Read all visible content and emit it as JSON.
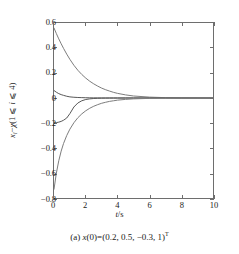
{
  "figure": {
    "caption_prefix": "(a) ",
    "caption_var": "x",
    "caption_rest": "(0)=(0.2, 0.5, −0.3, 1)",
    "caption_sup": "T",
    "caption_full": "(a) x(0)=(0.2, 0.5, −0.3, 1)T"
  },
  "axes": {
    "xlabel_var": "t",
    "xlabel_slash": "/",
    "xlabel_unit": "s",
    "xlabel_full": "t/s",
    "ylabel_var": "x",
    "ylabel_sub": "i",
    "ylabel_mid": "−",
    "ylabel_chi": "χ",
    "ylabel_cond": "(1 ⩽ i ⩽ 4)",
    "ylabel_full": "xᵢ−χ(1 ⩽ i ⩽ 4)",
    "xticks": [
      "0",
      "2",
      "4",
      "6",
      "8",
      "10"
    ],
    "yticks": [
      "0.6",
      "0.4",
      "0.2",
      "0",
      "−0.2",
      "−0.4",
      "−0.6",
      "−0.8"
    ]
  },
  "colors": {
    "curve": "#7d7d7d",
    "curve_dark": "#585858",
    "frame": "#6e6e6e",
    "text": "#1a1a1a",
    "background": "#ffffff"
  },
  "chart_data": {
    "type": "line",
    "title": "",
    "subtitle": "",
    "xlabel": "t/s",
    "ylabel": "x_i − χ (1 ⩽ i ⩽ 4)",
    "xlim": [
      0,
      10
    ],
    "ylim": [
      -0.8,
      0.6
    ],
    "xticks": [
      0,
      2,
      4,
      6,
      8,
      10
    ],
    "yticks": [
      0.6,
      0.4,
      0.2,
      0,
      -0.2,
      -0.4,
      -0.6,
      -0.8
    ],
    "grid": false,
    "legend": null,
    "annotations": [
      "(a) x(0)=(0.2, 0.5, −0.3, 1)^T"
    ],
    "x": [
      0,
      0.15,
      0.3,
      0.45,
      0.6,
      0.8,
      1.0,
      1.25,
      1.5,
      1.75,
      2.0,
      2.25,
      2.5,
      2.75,
      3.0,
      3.25,
      3.5,
      3.75,
      4.0,
      4.5,
      5.0,
      6.0,
      7.0,
      8.0,
      9.0,
      10.0
    ],
    "series": [
      {
        "name": "x1 − χ",
        "color": "#7d7d7d",
        "values": [
          0.56,
          0.515,
          0.473,
          0.434,
          0.397,
          0.351,
          0.309,
          0.262,
          0.222,
          0.188,
          0.159,
          0.134,
          0.113,
          0.095,
          0.079,
          0.066,
          0.055,
          0.045,
          0.037,
          0.025,
          0.016,
          0.007,
          0.003,
          0.001,
          0.0005,
          0.0
        ]
      },
      {
        "name": "x2 − χ",
        "color": "#585858",
        "values": [
          0.06,
          0.046,
          0.035,
          0.027,
          0.021,
          0.014,
          0.009,
          0.006,
          0.004,
          0.003,
          0.002,
          0.0015,
          0.001,
          0.0008,
          0.0006,
          0.0004,
          0.0003,
          0.0002,
          0.0002,
          0.0001,
          0.0001,
          0.0,
          0.0,
          0.0,
          0.0,
          0.0
        ]
      },
      {
        "name": "x3 − χ",
        "color": "#585858",
        "values": [
          -0.2,
          -0.197,
          -0.193,
          -0.187,
          -0.178,
          -0.16,
          -0.125,
          -0.072,
          -0.04,
          -0.022,
          -0.012,
          -0.007,
          -0.004,
          -0.0025,
          -0.0015,
          -0.001,
          -0.0006,
          -0.0004,
          -0.0003,
          -0.0001,
          -5e-05,
          0.0,
          0.0,
          0.0,
          0.0,
          0.0
        ]
      },
      {
        "name": "x4 − χ",
        "color": "#7d7d7d",
        "values": [
          -0.73,
          -0.6,
          -0.502,
          -0.425,
          -0.364,
          -0.3,
          -0.249,
          -0.198,
          -0.158,
          -0.127,
          -0.102,
          -0.082,
          -0.066,
          -0.053,
          -0.042,
          -0.034,
          -0.027,
          -0.022,
          -0.017,
          -0.011,
          -0.007,
          -0.003,
          -0.001,
          -0.0005,
          -0.0002,
          0.0
        ]
      }
    ]
  }
}
